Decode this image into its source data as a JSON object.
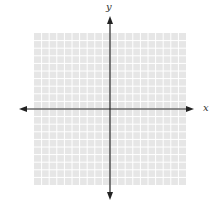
{
  "diagram": {
    "type": "coordinate-plane",
    "x_axis_label": "x",
    "y_axis_label": "y",
    "grid": {
      "columns": 20,
      "rows": 20,
      "left": 34,
      "top": 33,
      "size": 152,
      "fill_color": "#e6e6e6",
      "line_color": "#ffffff"
    },
    "axes": {
      "origin": [
        110,
        109
      ],
      "x_extent": [
        19,
        194
      ],
      "y_extent": [
        16,
        200
      ],
      "color": "#222222",
      "arrows": "both-ends"
    }
  }
}
